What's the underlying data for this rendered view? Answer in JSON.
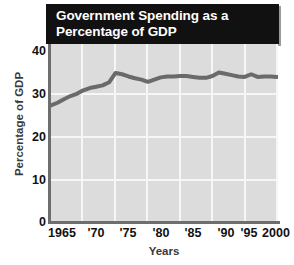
{
  "title": {
    "line1": "Government Spending as a",
    "line2": "Percentage of GDP",
    "full": "Government Spending as a Percentage of GDP"
  },
  "axes": {
    "ylabel": "Percentage of GDP",
    "xlabel": "Years",
    "yticks": [
      "40",
      "30",
      "20",
      "10",
      "0"
    ],
    "xticks": [
      "1965",
      "'70",
      "'75",
      "'80",
      "'85",
      "'90",
      "'95",
      "2000"
    ]
  },
  "colors": {
    "banner_bg": "#111111",
    "banner_text": "#ffffff",
    "plot_bg": "#dcdcdc",
    "gridline": "#f6f6f6",
    "axis": "#6e6e6e",
    "series": "#6a6a6a",
    "tick_text": "#111111",
    "axis_title_text": "#3a3a3a"
  },
  "chart_data": {
    "type": "line",
    "title": "Government Spending as a Percentage of GDP",
    "xlabel": "Years",
    "ylabel": "Percentage of GDP",
    "xlim": [
      1965,
      2000
    ],
    "ylim": [
      0,
      40
    ],
    "yticks": [
      0,
      10,
      20,
      30,
      40
    ],
    "xticks": [
      1965,
      1970,
      1975,
      1980,
      1985,
      1990,
      1995,
      2000
    ],
    "xtick_labels": [
      "1965",
      "'70",
      "'75",
      "'80",
      "'85",
      "'90",
      "'95",
      "2000"
    ],
    "grid": true,
    "legend": false,
    "series": [
      {
        "name": "Government Spending as a Percentage of GDP",
        "color": "#6a6a6a",
        "x": [
          1965,
          1966,
          1967,
          1968,
          1969,
          1970,
          1971,
          1972,
          1973,
          1974,
          1975,
          1976,
          1977,
          1978,
          1979,
          1980,
          1981,
          1982,
          1983,
          1984,
          1985,
          1986,
          1987,
          1988,
          1989,
          1990,
          1991,
          1992,
          1993,
          1994,
          1995,
          1996,
          1997,
          1998,
          1999,
          2000
        ],
        "values": [
          26.2,
          26.8,
          27.6,
          28.3,
          28.8,
          29.6,
          30.1,
          30.4,
          30.7,
          31.4,
          33.5,
          33.2,
          32.7,
          32.3,
          32.0,
          31.5,
          32.0,
          32.5,
          32.7,
          32.7,
          32.8,
          32.8,
          32.6,
          32.4,
          32.4,
          32.8,
          33.6,
          33.3,
          33.0,
          32.7,
          32.6,
          33.2,
          32.6,
          32.7,
          32.7,
          32.6
        ]
      }
    ]
  }
}
